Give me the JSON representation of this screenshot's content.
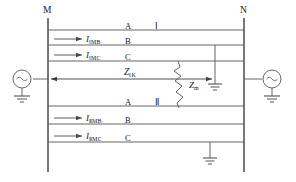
{
  "diagram": {
    "type": "double-circuit-transmission-line-fault",
    "colors": {
      "line": "#555555",
      "bus": "#4a4a4a",
      "text": "#1a1a1a",
      "background": "#ffffff"
    },
    "buses": {
      "left": {
        "label": "M",
        "x": 48,
        "y_top": 18,
        "y_bottom": 172
      },
      "right": {
        "label": "N",
        "x": 244,
        "y_top": 18,
        "y_bottom": 172
      }
    },
    "sources": {
      "left": {
        "symbol": "~",
        "name": "ac-source-m"
      },
      "right": {
        "symbol": "~",
        "name": "ac-source-n"
      }
    },
    "circuit_one": {
      "roman": "Ⅰ",
      "phases": [
        {
          "label": "A",
          "y": 30,
          "current": null
        },
        {
          "label": "B",
          "y": 45,
          "current": "I",
          "current_sub": "ⅠMB"
        },
        {
          "label": "C",
          "y": 61,
          "current": "I",
          "current_sub": "ⅠMC"
        }
      ]
    },
    "circuit_two": {
      "roman": "Ⅱ",
      "phases": [
        {
          "label": "A",
          "y": 106,
          "current": null
        },
        {
          "label": "B",
          "y": 124,
          "current": "I",
          "current_sub": "ⅡMB"
        },
        {
          "label": "C",
          "y": 142,
          "current": "I",
          "current_sub": "ⅡMC"
        }
      ]
    },
    "impedances": {
      "line_section": {
        "symbol": "Z",
        "subscript": "ⅠK",
        "label": "ZⅠK"
      },
      "fault": {
        "symbol": "Z",
        "subscript": "m",
        "label": "Zm"
      }
    },
    "labels": {
      "bus_m": "M",
      "bus_n": "N",
      "phase_a_1": "A",
      "phase_b_1": "B",
      "phase_c_1": "C",
      "phase_a_2": "A",
      "phase_b_2": "B",
      "phase_c_2": "C",
      "roman_one": "Ⅰ",
      "roman_two": "Ⅱ",
      "current_1b": "I",
      "current_1b_sub": "ⅠMB",
      "current_1c": "I",
      "current_1c_sub": "ⅠMC",
      "current_2b": "I",
      "current_2b_sub": "ⅡMB",
      "current_2c": "I",
      "current_2c_sub": "ⅡMC",
      "z_ik": "Z",
      "z_ik_sub": "ⅠK",
      "z_m": "Z",
      "z_m_sub": "m",
      "source_symbol_left": "~",
      "source_symbol_right": "~"
    },
    "grounds": [
      {
        "name": "ground-source-m",
        "x": 22,
        "y": 100
      },
      {
        "name": "ground-source-n",
        "x": 274,
        "y": 100
      },
      {
        "name": "ground-fault-upper",
        "x": 215,
        "y": 92
      },
      {
        "name": "ground-fault-lower",
        "x": 210,
        "y": 166
      }
    ]
  }
}
